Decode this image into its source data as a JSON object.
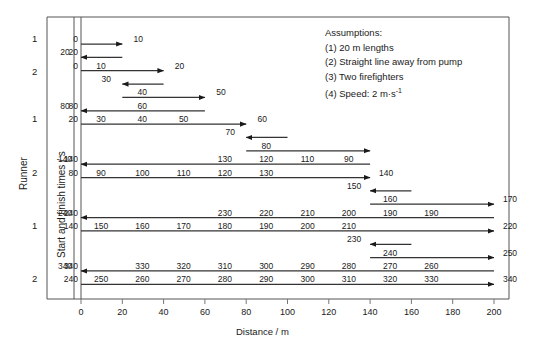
{
  "axes": {
    "x_title": "Distance / m",
    "y_title": "Start and finish times / s",
    "outer_title": "Runner",
    "x_ticks": [
      0,
      20,
      40,
      60,
      80,
      100,
      120,
      140,
      160,
      180,
      200
    ],
    "x_min": 0,
    "x_max": 210,
    "runner_labels": [
      "1",
      "2",
      "1",
      "2",
      "1",
      "2"
    ]
  },
  "assumptions": {
    "heading": "Assumptions:",
    "items": [
      "(1) 20 m lengths",
      "(2) Straight line away from pump",
      "(3) Two firefighters",
      "(4) Speed: 2 m·s",
      "-1"
    ],
    "line1": "(1) 20 m lengths",
    "line2": "(2) Straight line away from pump",
    "line3": "(3) Two firefighters",
    "line4a": "(4) Speed: 2 m·s",
    "line4b": "-1"
  },
  "chart_data": {
    "type": "line",
    "title": "",
    "xlabel": "Distance / m",
    "ylabel": "Start and finish times / s",
    "xlim": [
      0,
      210
    ],
    "grid": false,
    "legend": "none",
    "note": "Each horizontal arrow is one journey leg of a firefighter (runner 1 or runner 2). x = distance in metres, the numbers printed along each leg are the clock times in seconds at each 20 m point. Speed 2 m/s, so 20 m = 10 s.",
    "legs": [
      {
        "index": 1,
        "runner": 1,
        "row": 0,
        "from_m": 0,
        "to_m": 20,
        "direction": "right",
        "start_time": 0,
        "end_time": 10,
        "start_label": "0",
        "end_label": "10",
        "mid_labels": []
      },
      {
        "index": 2,
        "runner": 1,
        "row": 1,
        "from_m": 20,
        "to_m": 0,
        "direction": "left",
        "start_time": 10,
        "end_time": 20,
        "start_label": "",
        "end_label": "20",
        "mid_labels": []
      },
      {
        "index": 3,
        "runner": 2,
        "row": 2,
        "from_m": 0,
        "to_m": 40,
        "direction": "right",
        "start_time": 0,
        "end_time": 20,
        "start_label": "0",
        "end_label": "20",
        "mid_labels": [
          {
            "m": 20,
            "t": "10"
          }
        ]
      },
      {
        "index": 4,
        "runner": 2,
        "row": 3,
        "from_m": 40,
        "to_m": 20,
        "direction": "left",
        "start_time": 20,
        "end_time": 30,
        "start_label": "",
        "end_label": "30",
        "mid_labels": []
      },
      {
        "index": 5,
        "runner": 2,
        "row": 4,
        "from_m": 20,
        "to_m": 60,
        "direction": "right",
        "start_time": 30,
        "end_time": 50,
        "start_label": "",
        "end_label": "50",
        "mid_labels": [
          {
            "m": 40,
            "t": "40"
          }
        ]
      },
      {
        "index": 6,
        "runner": 2,
        "row": 5,
        "from_m": 60,
        "to_m": 0,
        "direction": "left",
        "start_time": 50,
        "end_time": 80,
        "start_label": "",
        "end_label": "80",
        "mid_labels": [
          {
            "m": 40,
            "t": "60"
          }
        ]
      },
      {
        "index": 7,
        "runner": 1,
        "row": 6,
        "from_m": 0,
        "to_m": 80,
        "direction": "right",
        "start_time": 20,
        "end_time": 60,
        "start_label": "20",
        "end_label": "60",
        "mid_labels": [
          {
            "m": 20,
            "t": "30"
          },
          {
            "m": 40,
            "t": "40"
          },
          {
            "m": 60,
            "t": "50"
          }
        ]
      },
      {
        "index": 8,
        "runner": 1,
        "row": 7,
        "from_m": 100,
        "to_m": 80,
        "direction": "left",
        "start_time": 60,
        "end_time": 70,
        "start_label": "",
        "end_label": "70",
        "mid_labels": []
      },
      {
        "index": 9,
        "runner": 1,
        "row": 8,
        "from_m": 80,
        "to_m": 140,
        "direction": "right",
        "start_time": 70,
        "end_time": 100,
        "start_label": "",
        "end_label": "",
        "mid_labels": [
          {
            "m": 100,
            "t": "80"
          }
        ]
      },
      {
        "index": 10,
        "runner": 1,
        "row": 9,
        "from_m": 140,
        "to_m": 0,
        "direction": "left",
        "start_time": 100,
        "end_time": 140,
        "start_label": "100",
        "end_label": "140",
        "mid_labels": [
          {
            "m": 120,
            "t": "110"
          },
          {
            "m": 100,
            "t": "120"
          },
          {
            "m": 80,
            "t": "130"
          },
          {
            "m": 140,
            "t": "90"
          }
        ]
      },
      {
        "index": 11,
        "runner": 2,
        "row": 10,
        "from_m": 0,
        "to_m": 140,
        "direction": "right",
        "start_time": 80,
        "end_time": 140,
        "start_label": "80",
        "end_label": "140",
        "mid_labels": [
          {
            "m": 20,
            "t": "90"
          },
          {
            "m": 40,
            "t": "100"
          },
          {
            "m": 60,
            "t": "110"
          },
          {
            "m": 80,
            "t": "120"
          },
          {
            "m": 100,
            "t": "130"
          }
        ]
      },
      {
        "index": 12,
        "runner": 2,
        "row": 11,
        "from_m": 160,
        "to_m": 140,
        "direction": "left",
        "start_time": 140,
        "end_time": 150,
        "start_label": "",
        "end_label": "150",
        "mid_labels": []
      },
      {
        "index": 13,
        "runner": 2,
        "row": 12,
        "from_m": 140,
        "to_m": 200,
        "direction": "right",
        "start_time": 150,
        "end_time": 180,
        "start_label": "",
        "end_label": "170",
        "mid_labels": [
          {
            "m": 160,
            "t": "160"
          }
        ]
      },
      {
        "index": 14,
        "runner": 2,
        "row": 13,
        "from_m": 200,
        "to_m": 0,
        "direction": "left",
        "start_time": 180,
        "end_time": 240,
        "start_label": "180",
        "end_label": "240",
        "mid_labels": [
          {
            "m": 180,
            "t": "190"
          },
          {
            "m": 160,
            "t": "190"
          },
          {
            "m": 140,
            "t": "200"
          },
          {
            "m": 120,
            "t": "210"
          },
          {
            "m": 100,
            "t": "220"
          },
          {
            "m": 80,
            "t": "230"
          }
        ]
      },
      {
        "index": 15,
        "runner": 1,
        "row": 14,
        "from_m": 0,
        "to_m": 200,
        "direction": "right",
        "start_time": 140,
        "end_time": 240,
        "start_label": "140",
        "end_label": "220",
        "mid_labels": [
          {
            "m": 20,
            "t": "150"
          },
          {
            "m": 40,
            "t": "160"
          },
          {
            "m": 60,
            "t": "170"
          },
          {
            "m": 80,
            "t": "180"
          },
          {
            "m": 100,
            "t": "190"
          },
          {
            "m": 120,
            "t": "200"
          },
          {
            "m": 140,
            "t": "210"
          }
        ]
      },
      {
        "index": 16,
        "runner": 1,
        "row": 15,
        "from_m": 160,
        "to_m": 140,
        "direction": "left",
        "start_time": 220,
        "end_time": 230,
        "start_label": "",
        "end_label": "230",
        "mid_labels": []
      },
      {
        "index": 17,
        "runner": 1,
        "row": 16,
        "from_m": 140,
        "to_m": 200,
        "direction": "right",
        "start_time": 230,
        "end_time": 250,
        "start_label": "",
        "end_label": "250",
        "mid_labels": [
          {
            "m": 160,
            "t": "240"
          }
        ]
      },
      {
        "index": 18,
        "runner": 1,
        "row": 17,
        "from_m": 200,
        "to_m": 0,
        "direction": "left",
        "start_time": 250,
        "end_time": 340,
        "start_label": "",
        "end_label": "340",
        "mid_labels": [
          {
            "m": 180,
            "t": "260"
          },
          {
            "m": 160,
            "t": "270"
          },
          {
            "m": 140,
            "t": "280"
          },
          {
            "m": 120,
            "t": "290"
          },
          {
            "m": 100,
            "t": "300"
          },
          {
            "m": 80,
            "t": "310"
          },
          {
            "m": 60,
            "t": "320"
          },
          {
            "m": 40,
            "t": "330"
          }
        ]
      },
      {
        "index": 19,
        "runner": 2,
        "row": 18,
        "from_m": 0,
        "to_m": 200,
        "direction": "right",
        "start_time": 240,
        "end_time": 340,
        "start_label": "240",
        "end_label": "340",
        "mid_labels": [
          {
            "m": 20,
            "t": "250"
          },
          {
            "m": 40,
            "t": "260"
          },
          {
            "m": 60,
            "t": "270"
          },
          {
            "m": 80,
            "t": "280"
          },
          {
            "m": 100,
            "t": "290"
          },
          {
            "m": 120,
            "t": "300"
          },
          {
            "m": 140,
            "t": "310"
          },
          {
            "m": 160,
            "t": "320"
          },
          {
            "m": 180,
            "t": "330"
          }
        ]
      }
    ],
    "left_axis_times": [
      {
        "row": 0,
        "label": "0"
      },
      {
        "row": 1,
        "label": "20"
      },
      {
        "row": 2,
        "label": "0"
      },
      {
        "row": 5,
        "label": "80"
      },
      {
        "row": 6,
        "label": "20"
      },
      {
        "row": 9,
        "label": "140"
      },
      {
        "row": 10,
        "label": "80"
      },
      {
        "row": 13,
        "label": "240"
      },
      {
        "row": 14,
        "label": "140"
      },
      {
        "row": 17,
        "label": "340"
      },
      {
        "row": 18,
        "label": "240"
      }
    ]
  }
}
